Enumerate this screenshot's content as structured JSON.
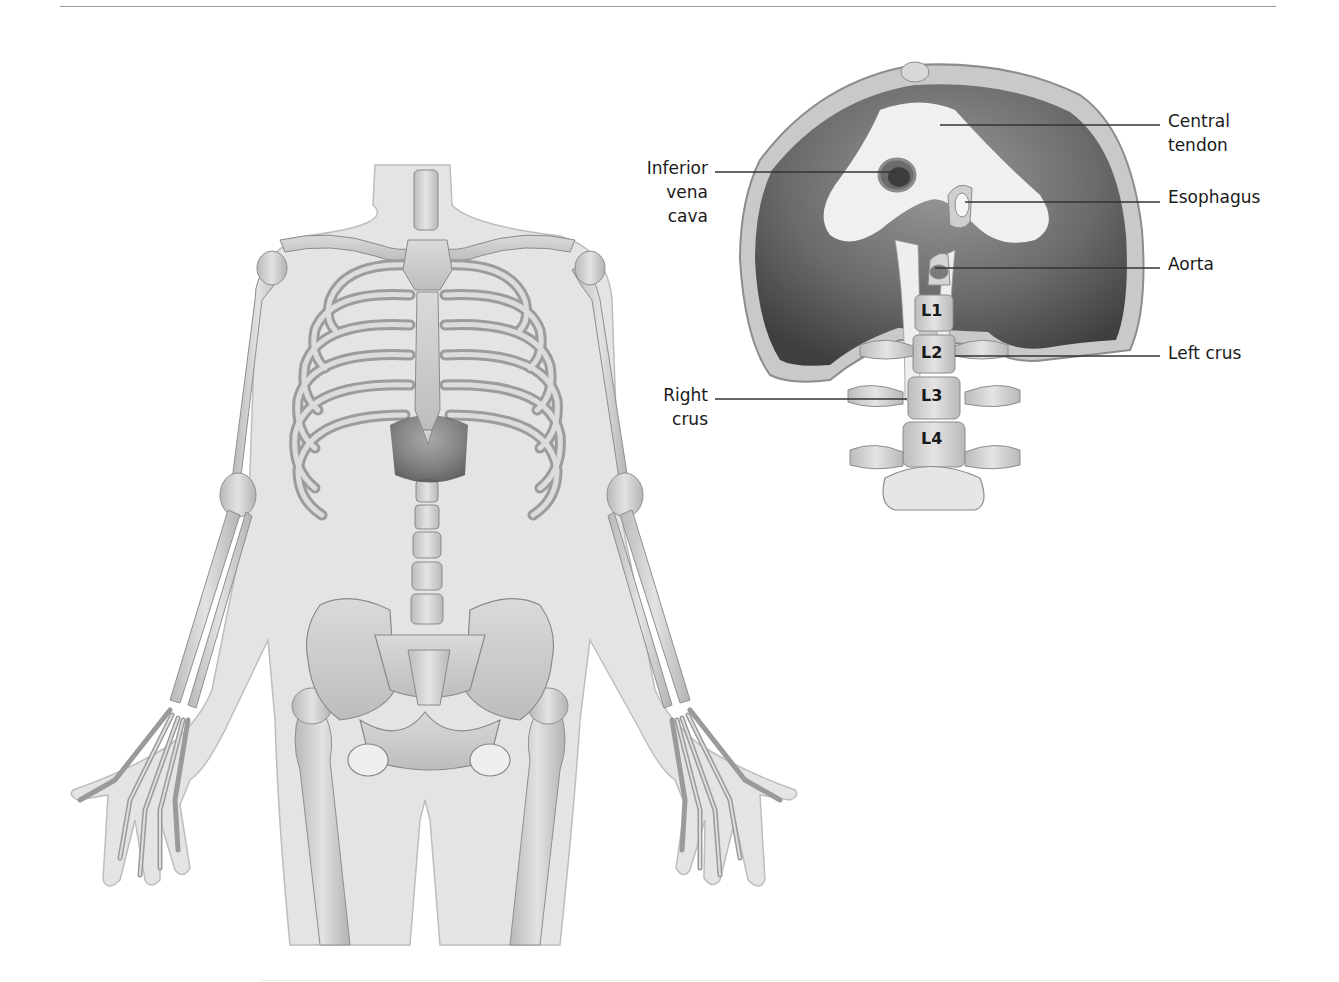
{
  "figure": {
    "left_panel": {
      "subject": "Anterior view of human skeleton within body outline showing rib cage and diaphragm"
    },
    "right_panel": {
      "subject": "Inferior view of the diaphragm with lumbar vertebrae",
      "labels": {
        "central_tendon": [
          "Central",
          "tendon"
        ],
        "inferior_vena_cava": [
          "Inferior",
          "vena",
          "cava"
        ],
        "esophagus": [
          "Esophagus"
        ],
        "aorta": [
          "Aorta"
        ],
        "left_crus": [
          "Left crus"
        ],
        "right_crus": [
          "Right",
          "crus"
        ]
      },
      "vertebrae": [
        "L1",
        "L2",
        "L3",
        "L4"
      ]
    }
  },
  "colors": {
    "rule": "#9a9a9a",
    "body_outline": "#e3e3e3",
    "bone": "#cfcfcf",
    "muscle_dark": "#5a5a5a",
    "tendon": "#f2f2f2",
    "leader_line": "#333333"
  }
}
